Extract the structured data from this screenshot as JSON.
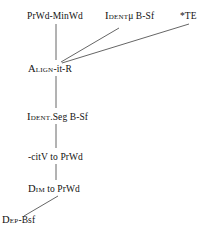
{
  "diagram": {
    "type": "constraint-ranking-hasse-diagram",
    "background_color": "#ffffff",
    "edge_color": "#666666",
    "text_color": "#121212",
    "nodes": [
      {
        "id": "prwd-minwd",
        "smallcaps": "",
        "label": "PrWd-MinWd",
        "x": 27,
        "y": 11,
        "rank": 1
      },
      {
        "id": "identmu-bsf",
        "smallcaps": "Ident",
        "label": "μ B-Sf",
        "x": 105,
        "y": 11,
        "rank": 1
      },
      {
        "id": "te",
        "smallcaps": "",
        "label": "*TE",
        "x": 180,
        "y": 11,
        "rank": 1
      },
      {
        "id": "align-it-r",
        "smallcaps": "Align",
        "label": "-it-R",
        "x": 28,
        "y": 64,
        "rank": 2
      },
      {
        "id": "ident-seg",
        "smallcaps": "Ident",
        "label": ".Seg B-Sf",
        "x": 27,
        "y": 112,
        "rank": 3
      },
      {
        "id": "citv-prwd",
        "smallcaps": "",
        "label": "-citV to PrWd",
        "x": 28,
        "y": 152,
        "rank": 4
      },
      {
        "id": "dim-prwd",
        "smallcaps": "Dim",
        "label": " to PrWd",
        "x": 28,
        "y": 184,
        "rank": 5
      },
      {
        "id": "dep-bsf",
        "smallcaps": "Dep",
        "label": "-Bsf",
        "x": 2,
        "y": 215,
        "rank": 6
      }
    ],
    "edges": [
      {
        "id": "edge-prwd-to-align",
        "from": "prwd-minwd",
        "to": "align-it-r",
        "x1": 56,
        "y1": 24,
        "x2": 56,
        "y2": 60
      },
      {
        "id": "edge-identmu-to-align",
        "from": "identmu-bsf",
        "to": "align-it-r",
        "x1": 119,
        "y1": 28,
        "x2": 61,
        "y2": 62
      },
      {
        "id": "edge-te-to-align",
        "from": "te",
        "to": "align-it-r",
        "x1": 189,
        "y1": 24,
        "x2": 62,
        "y2": 63
      },
      {
        "id": "edge-align-to-identseg",
        "from": "align-it-r",
        "to": "ident-seg",
        "x1": 56,
        "y1": 76,
        "x2": 56,
        "y2": 108
      },
      {
        "id": "edge-identseg-to-citv",
        "from": "ident-seg",
        "to": "citv-prwd",
        "x1": 56,
        "y1": 124,
        "x2": 56,
        "y2": 148
      },
      {
        "id": "edge-citv-to-dim",
        "from": "citv-prwd",
        "to": "dim-prwd",
        "x1": 56,
        "y1": 164,
        "x2": 56,
        "y2": 180
      },
      {
        "id": "edge-dim-to-dep",
        "from": "dim-prwd",
        "to": "dep-bsf",
        "x1": 58,
        "y1": 196,
        "x2": 24,
        "y2": 216
      }
    ]
  }
}
